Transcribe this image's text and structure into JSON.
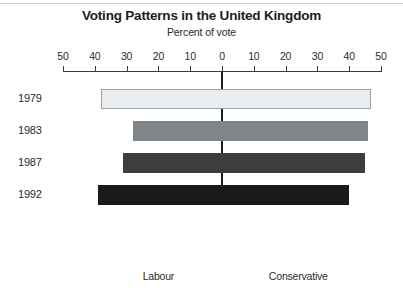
{
  "chart_data": {
    "type": "bar",
    "orientation": "horizontal-diverging",
    "title": "Voting Patterns in the United Kingdom",
    "subtitle": "Percent of vote",
    "xlabel": "Percent of vote",
    "ylabel": "",
    "grid": false,
    "legend": "none",
    "xlim": [
      -50,
      50
    ],
    "axis_tick_labels": [
      "50",
      "40",
      "30",
      "20",
      "10",
      "0",
      "10",
      "20",
      "30",
      "40",
      "50"
    ],
    "axis_tick_values": [
      -50,
      -40,
      -30,
      -20,
      -10,
      0,
      10,
      20,
      30,
      40,
      50
    ],
    "categories": [
      "1979",
      "1983",
      "1987",
      "1992"
    ],
    "side_labels": {
      "left": "Labour",
      "right": "Conservative"
    },
    "series": [
      {
        "name": "Labour",
        "values": [
          38,
          28,
          31,
          39
        ]
      },
      {
        "name": "Conservative",
        "values": [
          47,
          46,
          45,
          39
        ]
      }
    ],
    "bars": [
      {
        "year": "1979",
        "labour": 38,
        "conservative": 47,
        "color": "#e9edef",
        "outlined": true
      },
      {
        "year": "1983",
        "labour": 28,
        "conservative": 46,
        "color": "#808589",
        "outlined": false
      },
      {
        "year": "1987",
        "labour": 31,
        "conservative": 45,
        "color": "#3b3d3f",
        "outlined": false
      },
      {
        "year": "1992",
        "labour": 39,
        "conservative": 40,
        "color": "#1b1b1b",
        "outlined": false
      }
    ],
    "colors": {
      "bar_1979": "#e9edef",
      "bar_1983": "#808589",
      "bar_1987": "#3b3d3f",
      "bar_1992": "#1b1b1b",
      "axis": "#3a3a3a",
      "text": "#2b2b2b",
      "background": "#ffffff"
    }
  }
}
